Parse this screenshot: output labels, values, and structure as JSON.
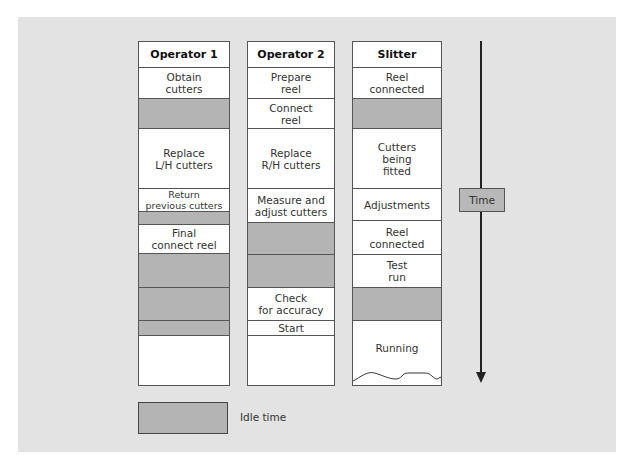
{
  "columns": [
    {
      "name": "operator-1",
      "left": 138,
      "width": 92,
      "cells": [
        {
          "label": "Operator 1",
          "type": "header",
          "top": 0,
          "height": 26
        },
        {
          "label": "Obtain\ncutters",
          "type": "task",
          "top": 26,
          "height": 31
        },
        {
          "label": "",
          "type": "idle",
          "top": 57,
          "height": 30
        },
        {
          "label": "Replace\nL/H cutters",
          "type": "task",
          "top": 87,
          "height": 60
        },
        {
          "label": "Return\nprevious cutters",
          "type": "task small",
          "top": 147,
          "height": 23
        },
        {
          "label": "",
          "type": "idle",
          "top": 170,
          "height": 13
        },
        {
          "label": "Final\nconnect reel",
          "type": "task",
          "top": 183,
          "height": 29
        },
        {
          "label": "",
          "type": "idle",
          "top": 212,
          "height": 34
        },
        {
          "label": "",
          "type": "idle",
          "top": 246,
          "height": 33
        },
        {
          "label": "",
          "type": "idle",
          "top": 279,
          "height": 15
        },
        {
          "label": "",
          "type": "task last",
          "top": 294,
          "height": 49
        }
      ]
    },
    {
      "name": "operator-2",
      "left": 247,
      "width": 88,
      "cells": [
        {
          "label": "Operator 2",
          "type": "header",
          "top": 0,
          "height": 26
        },
        {
          "label": "Prepare\nreel",
          "type": "task",
          "top": 26,
          "height": 31
        },
        {
          "label": "Connect\nreel",
          "type": "task",
          "top": 57,
          "height": 30
        },
        {
          "label": "Replace\nR/H cutters",
          "type": "task",
          "top": 87,
          "height": 60
        },
        {
          "label": "Measure and\nadjust cutters",
          "type": "task",
          "top": 147,
          "height": 34
        },
        {
          "label": "",
          "type": "idle",
          "top": 181,
          "height": 32
        },
        {
          "label": "",
          "type": "idle",
          "top": 213,
          "height": 33
        },
        {
          "label": "Check\nfor accuracy",
          "type": "task",
          "top": 246,
          "height": 33
        },
        {
          "label": "Start",
          "type": "task",
          "top": 279,
          "height": 15
        },
        {
          "label": "",
          "type": "task last",
          "top": 294,
          "height": 49
        }
      ]
    },
    {
      "name": "slitter",
      "left": 352,
      "width": 90,
      "cells": [
        {
          "label": "Slitter",
          "type": "header",
          "top": 0,
          "height": 26
        },
        {
          "label": "Reel\nconnected",
          "type": "task",
          "top": 26,
          "height": 31
        },
        {
          "label": "",
          "type": "idle",
          "top": 57,
          "height": 30
        },
        {
          "label": "Cutters\nbeing\nfitted",
          "type": "task",
          "top": 87,
          "height": 60
        },
        {
          "label": "Adjustments",
          "type": "task",
          "top": 147,
          "height": 32
        },
        {
          "label": "Reel\nconnected",
          "type": "task",
          "top": 179,
          "height": 34
        },
        {
          "label": "Test\nrun",
          "type": "task",
          "top": 213,
          "height": 33
        },
        {
          "label": "",
          "type": "idle",
          "top": 246,
          "height": 33
        },
        {
          "label": "Running",
          "type": "task last running",
          "top": 279,
          "height": 64
        }
      ]
    }
  ],
  "time_axis": {
    "label": "Time"
  },
  "legend": {
    "label": "Idle time"
  },
  "colors": {
    "idle": "#b4b4b4",
    "background": "#e3e3e3",
    "border": "#555555"
  }
}
